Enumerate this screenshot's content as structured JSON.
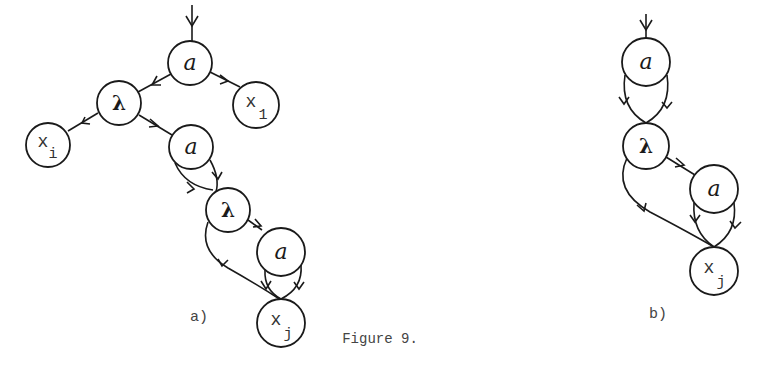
{
  "figure": {
    "caption": "Figure 9.",
    "diagrams": [
      {
        "label": "a)",
        "nodes": [
          {
            "id": "a1",
            "text": "a"
          },
          {
            "id": "l1",
            "text": "λ"
          },
          {
            "id": "x1",
            "text": "x",
            "sub": "1"
          },
          {
            "id": "xi",
            "text": "x",
            "sub": "i"
          },
          {
            "id": "a2",
            "text": "a"
          },
          {
            "id": "l2",
            "text": "λ"
          },
          {
            "id": "a3",
            "text": "a"
          },
          {
            "id": "xj",
            "text": "x",
            "sub": "j"
          }
        ],
        "edges": [
          [
            "entry",
            "a1"
          ],
          [
            "a1",
            "l1"
          ],
          [
            "a1",
            "x1"
          ],
          [
            "l1",
            "xi"
          ],
          [
            "l1",
            "a2"
          ],
          [
            "a2",
            "l2"
          ],
          [
            "a2",
            "l2"
          ],
          [
            "l2",
            "a3"
          ],
          [
            "l2",
            "xj"
          ],
          [
            "a3",
            "xj"
          ],
          [
            "a3",
            "xj"
          ]
        ]
      },
      {
        "label": "b)",
        "nodes": [
          {
            "id": "a1",
            "text": "a"
          },
          {
            "id": "l1",
            "text": "λ"
          },
          {
            "id": "a2",
            "text": "a"
          },
          {
            "id": "xj",
            "text": "x",
            "sub": "j"
          }
        ],
        "edges": [
          [
            "entry",
            "a1"
          ],
          [
            "a1",
            "l1"
          ],
          [
            "a1",
            "l1"
          ],
          [
            "l1",
            "a2"
          ],
          [
            "l1",
            "xj"
          ],
          [
            "a2",
            "xj"
          ],
          [
            "a2",
            "xj"
          ]
        ]
      }
    ]
  }
}
